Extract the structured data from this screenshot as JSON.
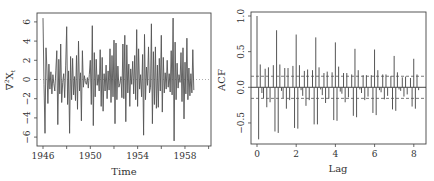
{
  "chart_data": [
    {
      "type": "line",
      "title": "",
      "xlabel": "Time",
      "ylabel": "∇²X_t",
      "xlim": [
        1945.5,
        1960.3
      ],
      "ylim": [
        -7,
        7
      ],
      "x_ticks": [
        1946,
        1950,
        1954,
        1958
      ],
      "x_minor_ticks": [
        1946,
        1948,
        1950,
        1952,
        1954,
        1956,
        1958,
        1960
      ],
      "y_ticks": [
        -6,
        -4,
        -2,
        0,
        2,
        4,
        6
      ],
      "grid": false,
      "reference_line": {
        "y": 0,
        "style": "dotted"
      },
      "frequency": 12,
      "start": 1946.0,
      "values": [
        6.4,
        -0.5,
        -5.6,
        3.3,
        1.2,
        -2.5,
        1.6,
        -1.0,
        0.8,
        -1.5,
        0.5,
        -0.4,
        -1.2,
        0.9,
        3.0,
        -4.7,
        2.1,
        -1.5,
        3.7,
        -2.4,
        -0.3,
        0.6,
        -1.9,
        1.5,
        5.5,
        -2.6,
        0.9,
        -5.6,
        2.4,
        -2.1,
        2.2,
        -1.6,
        0.3,
        -2.2,
        2.5,
        -3.1,
        4.0,
        -1.2,
        0.7,
        -4.3,
        3.0,
        -0.8,
        0.4,
        -0.3,
        -0.5,
        0.2,
        -0.9,
        0.5,
        2.0,
        -2.6,
        5.6,
        -4.8,
        2.8,
        -1.8,
        2.1,
        -0.6,
        0.5,
        -1.2,
        3.1,
        -2.8,
        2.3,
        -3.3,
        0.6,
        -1.2,
        1.5,
        -2.0,
        0.9,
        -1.1,
        3.2,
        -2.4,
        2.5,
        -1.8,
        4.1,
        -4.6,
        3.8,
        -2.1,
        1.4,
        -0.8,
        -0.4,
        0.3,
        -1.9,
        3.7,
        -2.0,
        4.6,
        -4.4,
        3.6,
        -1.4,
        1.6,
        -2.8,
        1.1,
        -0.5,
        1.9,
        -1.5,
        2.5,
        -2.1,
        5.2,
        -2.8,
        3.2,
        -1.0,
        0.5,
        -1.8,
        2.6,
        -5.8,
        4.7,
        -2.1,
        1.3,
        -0.6,
        3.4,
        -1.4,
        -0.8,
        5.8,
        -4.6,
        2.9,
        -2.6,
        3.4,
        -3.0,
        1.5,
        -2.9,
        2.2,
        -1.2,
        4.6,
        -3.4,
        2.3,
        -1.4,
        0.7,
        -1.0,
        2.0,
        -0.8,
        0.6,
        -1.3,
        3.0,
        -1.6,
        6.4,
        -6.4,
        3.9,
        -2.1,
        1.7,
        -0.9,
        0.5,
        -0.3,
        2.8,
        -2.3,
        3.3,
        -4.1,
        1.8,
        -1.5,
        4.3,
        -2.1,
        1.2,
        -1.7,
        0.6,
        -1.4,
        3.1,
        -1.1
      ]
    },
    {
      "type": "bar",
      "title": "",
      "xlabel": "Lag",
      "ylabel": "ACF",
      "xlim": [
        -0.3,
        8.7
      ],
      "ylim": [
        -0.78,
        1.05
      ],
      "x_ticks": [
        0,
        2,
        4,
        6,
        8
      ],
      "y_ticks": [
        -0.5,
        0.0,
        0.5,
        1.0
      ],
      "grid": false,
      "confidence_band": {
        "upper": 0.155,
        "lower": -0.155,
        "style": "dashed"
      },
      "lag_step": 0.0833,
      "values": [
        1.0,
        -0.73,
        0.32,
        -0.08,
        -0.15,
        0.26,
        -0.28,
        0.28,
        -0.21,
        0.0,
        0.31,
        -0.62,
        0.8,
        -0.64,
        0.32,
        -0.05,
        -0.15,
        0.27,
        -0.3,
        0.27,
        -0.18,
        0.0,
        0.3,
        -0.57,
        0.74,
        -0.58,
        0.31,
        -0.04,
        -0.12,
        0.23,
        -0.26,
        0.25,
        -0.18,
        0.0,
        0.24,
        -0.52,
        0.7,
        -0.52,
        0.28,
        -0.03,
        -0.11,
        0.2,
        -0.22,
        0.22,
        -0.16,
        0.0,
        0.21,
        -0.46,
        0.63,
        -0.47,
        0.29,
        -0.06,
        -0.09,
        0.2,
        -0.21,
        0.2,
        -0.14,
        0.0,
        0.18,
        -0.4,
        0.54,
        -0.42,
        0.24,
        -0.03,
        -0.08,
        0.17,
        -0.18,
        0.17,
        -0.13,
        0.0,
        0.17,
        -0.36,
        0.53,
        -0.39,
        0.24,
        -0.04,
        -0.07,
        0.18,
        -0.17,
        0.18,
        -0.12,
        0.0,
        0.16,
        -0.31,
        0.44,
        -0.33,
        0.21,
        -0.03,
        -0.05,
        0.14,
        -0.13,
        0.15,
        -0.1,
        0.0,
        0.13,
        -0.27,
        0.4,
        -0.3,
        0.18,
        -0.04
      ]
    }
  ],
  "left_panel": {
    "ylabel_main": "∇",
    "ylabel_sup": "2",
    "ylabel_var": "X",
    "ylabel_sub": "t",
    "xlabel": "Time",
    "x_tick_labels": [
      "1946",
      "1950",
      "1954",
      "1958"
    ],
    "y_tick_labels": [
      "-6",
      "-4",
      "-2",
      "0",
      "2",
      "4",
      "6"
    ]
  },
  "right_panel": {
    "ylabel": "ACF",
    "xlabel": "Lag",
    "x_tick_labels": [
      "0",
      "2",
      "4",
      "6",
      "8"
    ],
    "y_tick_labels": [
      "-0.5",
      "0.0",
      "0.5",
      "1.0"
    ]
  },
  "colors": {
    "line": "#555555",
    "axis": "#444444",
    "text": "#333333",
    "background": "#ffffff"
  }
}
